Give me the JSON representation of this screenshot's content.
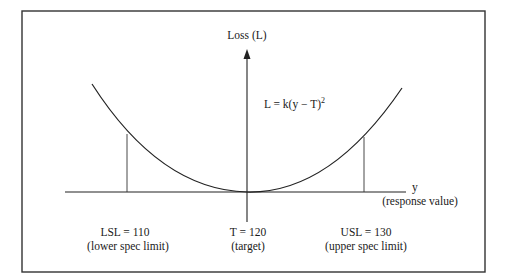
{
  "diagram": {
    "y_axis_label": "Loss (L)",
    "formula": {
      "main": "L = k(y − T)",
      "exponent": "2"
    },
    "x_axis_label": "y",
    "x_axis_sublabel": "(response value)",
    "markers": [
      {
        "id": "lsl",
        "value_label": "LSL = 110",
        "desc_label": "(lower spec limit)"
      },
      {
        "id": "target",
        "value_label": "T = 120",
        "desc_label": "(target)"
      },
      {
        "id": "usl",
        "value_label": "USL = 130",
        "desc_label": "(upper spec limit)"
      }
    ],
    "colors": {
      "line": "#222222",
      "background": "#ffffff"
    }
  }
}
